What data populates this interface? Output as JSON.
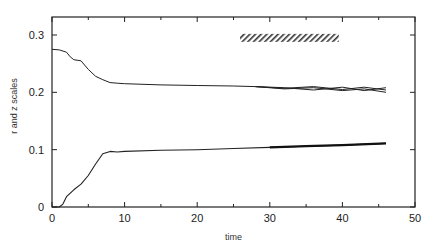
{
  "chart_data": {
    "type": "line",
    "title": "",
    "xlabel": "time",
    "ylabel": "r and z scales",
    "xlim": [
      0,
      50
    ],
    "ylim": [
      0,
      0.33
    ],
    "grid": false,
    "legend": null,
    "x_ticks": [
      "0",
      "10",
      "20",
      "30",
      "40",
      "50"
    ],
    "y_ticks": [
      "0",
      "0.1",
      "0.2",
      "0.3"
    ],
    "annotation": {
      "type": "hatched-bar",
      "x_start": 25.9,
      "x_end": 39.5,
      "y": 0.295
    },
    "series": [
      {
        "name": "upper scale",
        "x": [
          0,
          1,
          2,
          2.5,
          3,
          4,
          5,
          6,
          7,
          8,
          9,
          10,
          15,
          20,
          25,
          28
        ],
        "y": [
          0.275,
          0.274,
          0.27,
          0.262,
          0.257,
          0.255,
          0.24,
          0.228,
          0.222,
          0.217,
          0.216,
          0.215,
          0.213,
          0.212,
          0.211,
          0.21
        ]
      },
      {
        "name": "upper bundle a",
        "x": [
          28,
          32,
          36,
          40,
          43,
          46
        ],
        "y": [
          0.21,
          0.206,
          0.208,
          0.203,
          0.206,
          0.2
        ]
      },
      {
        "name": "upper bundle b",
        "x": [
          28,
          32,
          36,
          40,
          43,
          46
        ],
        "y": [
          0.21,
          0.208,
          0.204,
          0.209,
          0.203,
          0.208
        ]
      },
      {
        "name": "upper bundle c",
        "x": [
          28,
          32,
          36,
          40,
          43,
          46
        ],
        "y": [
          0.21,
          0.207,
          0.21,
          0.205,
          0.209,
          0.204
        ]
      },
      {
        "name": "lower scale",
        "x": [
          0,
          1,
          1.5,
          2,
          3,
          4,
          5,
          6,
          7,
          8,
          9,
          10,
          15,
          20,
          25,
          30,
          35,
          40,
          46
        ],
        "y": [
          0,
          0,
          0.005,
          0.018,
          0.03,
          0.04,
          0.055,
          0.075,
          0.093,
          0.097,
          0.096,
          0.097,
          0.099,
          0.1,
          0.102,
          0.104,
          0.106,
          0.108,
          0.111
        ]
      }
    ]
  }
}
